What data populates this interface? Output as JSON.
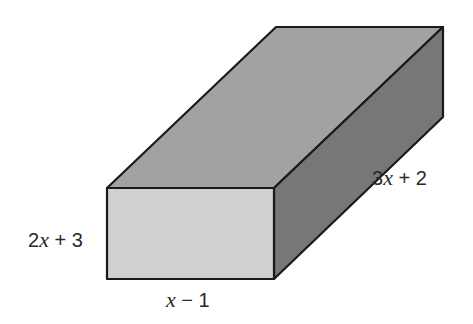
{
  "diagram": {
    "type": "rectangular-prism",
    "colors": {
      "top_face": "#a2a2a2",
      "front_face": "#d0d0d0",
      "side_face": "#777777",
      "outline": "#1a1a1a",
      "label": "#2a2a2a"
    },
    "labels": {
      "height": {
        "coef": "2",
        "var": "x",
        "rest": " + 3"
      },
      "length": {
        "coef": "3",
        "var": "x",
        "rest": " + 2"
      },
      "width": {
        "coef": "",
        "var": "x",
        "rest": " − 1"
      }
    }
  }
}
